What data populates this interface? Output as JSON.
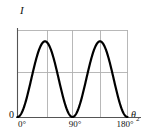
{
  "figure": {
    "axis_label_y": "I",
    "axis_label_x_symbol": "θ",
    "axis_label_x_subscript": "2",
    "origin_label": "0",
    "curve_color": "#000000",
    "grid_color": "#b0b0b0",
    "axis_color": "#555555",
    "background": "#ffffff"
  },
  "chart_data": {
    "type": "line",
    "title": "",
    "xlabel": "θ₂",
    "ylabel": "I",
    "xlim": [
      0,
      180
    ],
    "ylim": [
      0,
      1.15
    ],
    "grid": true,
    "legend": null,
    "xticks": [
      0,
      90,
      180
    ],
    "xtick_labels": [
      "0°",
      "90°",
      "180°"
    ],
    "yticks": [
      0
    ],
    "ytick_labels": [
      "0"
    ],
    "gridlines_vertical_deg": [
      45,
      90,
      135,
      180
    ],
    "gridlines_horizontal": [
      0.5,
      1.15
    ],
    "series": [
      {
        "name": "I(θ₂)",
        "formula": "sin^2(2*theta)",
        "x": [
          0,
          5,
          10,
          15,
          20,
          25,
          30,
          35,
          40,
          45,
          50,
          55,
          60,
          65,
          70,
          75,
          80,
          85,
          90,
          95,
          100,
          105,
          110,
          115,
          120,
          125,
          130,
          135,
          140,
          145,
          150,
          155,
          160,
          165,
          170,
          175,
          180
        ],
        "y": [
          0.0,
          0.03,
          0.12,
          0.25,
          0.41,
          0.59,
          0.75,
          0.88,
          0.97,
          1.0,
          0.97,
          0.88,
          0.75,
          0.59,
          0.41,
          0.25,
          0.12,
          0.03,
          0.0,
          0.03,
          0.12,
          0.25,
          0.41,
          0.59,
          0.75,
          0.88,
          0.97,
          1.0,
          0.97,
          0.88,
          0.75,
          0.59,
          0.41,
          0.25,
          0.12,
          0.03,
          0.0
        ],
        "peaks_deg": [
          45,
          135
        ],
        "minima_deg": [
          0,
          90,
          180
        ]
      }
    ]
  }
}
